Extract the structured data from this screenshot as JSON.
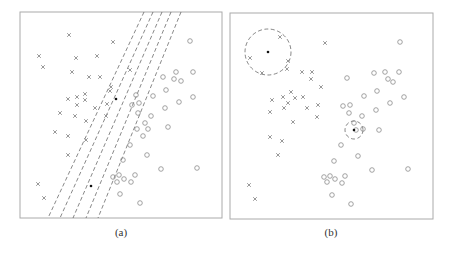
{
  "panels": [
    {
      "id": "a",
      "caption": "(a)",
      "box": {
        "x": 20,
        "y": 12,
        "w": 202,
        "h": 206
      },
      "description": "Several dashed decision lines passing through a common point between classes",
      "crosses": [
        [
          69,
          35
        ],
        [
          39,
          56
        ],
        [
          113,
          42
        ],
        [
          76,
          58
        ],
        [
          97,
          56
        ],
        [
          43,
          67
        ],
        [
          72,
          72
        ],
        [
          89,
          77
        ],
        [
          100,
          77
        ],
        [
          130,
          70
        ],
        [
          111,
          87
        ],
        [
          110,
          91
        ],
        [
          85,
          94
        ],
        [
          77,
          97
        ],
        [
          68,
          99
        ],
        [
          85,
          100
        ],
        [
          77,
          105
        ],
        [
          95,
          108
        ],
        [
          107,
          104
        ],
        [
          60,
          113
        ],
        [
          75,
          116
        ],
        [
          106,
          116
        ],
        [
          86,
          121
        ],
        [
          55,
          132
        ],
        [
          68,
          136
        ],
        [
          86,
          140
        ],
        [
          68,
          155
        ],
        [
          38,
          184
        ],
        [
          44,
          198
        ]
      ],
      "circles": [
        [
          190,
          41
        ],
        [
          163,
          77
        ],
        [
          176,
          72
        ],
        [
          193,
          72
        ],
        [
          174,
          79
        ],
        [
          181,
          81
        ],
        [
          136,
          95
        ],
        [
          153,
          96
        ],
        [
          166,
          90
        ],
        [
          193,
          97
        ],
        [
          132,
          105
        ],
        [
          139,
          103
        ],
        [
          179,
          102
        ],
        [
          165,
          108
        ],
        [
          138,
          113
        ],
        [
          151,
          116
        ],
        [
          145,
          123
        ],
        [
          137,
          129
        ],
        [
          148,
          129
        ],
        [
          168,
          127
        ],
        [
          143,
          136
        ],
        [
          130,
          145
        ],
        [
          147,
          155
        ],
        [
          123,
          160
        ],
        [
          161,
          169
        ],
        [
          197,
          168
        ],
        [
          113,
          177
        ],
        [
          119,
          175
        ],
        [
          124,
          179
        ],
        [
          117,
          182
        ],
        [
          135,
          175
        ],
        [
          131,
          182
        ],
        [
          120,
          194
        ],
        [
          140,
          203
        ]
      ],
      "filled_points": [
        [
          116,
          99
        ],
        [
          91,
          186
        ]
      ],
      "dashed_lines": [
        {
          "top": [
            144,
            12
          ],
          "bottom": [
            48,
            218
          ]
        },
        {
          "top": [
            153,
            12
          ],
          "bottom": [
            60,
            218
          ]
        },
        {
          "top": [
            162,
            12
          ],
          "bottom": [
            73,
            218
          ]
        },
        {
          "top": [
            171,
            12
          ],
          "bottom": [
            86,
            218
          ]
        },
        {
          "top": [
            181,
            12
          ],
          "bottom": [
            98,
            218
          ]
        }
      ]
    },
    {
      "id": "b",
      "caption": "(b)",
      "box": {
        "x": 230,
        "y": 13,
        "w": 203,
        "h": 206
      },
      "description": "Dashed circles centered at query points showing nearest-neighbor regions",
      "crosses": [
        [
          280,
          37
        ],
        [
          325,
          43
        ],
        [
          250,
          58
        ],
        [
          288,
          61
        ],
        [
          287,
          69
        ],
        [
          262,
          73
        ],
        [
          302,
          72
        ],
        [
          312,
          72
        ],
        [
          321,
          87
        ],
        [
          311,
          79
        ],
        [
          291,
          92
        ],
        [
          295,
          98
        ],
        [
          283,
          97
        ],
        [
          303,
          97
        ],
        [
          288,
          103
        ],
        [
          318,
          105
        ],
        [
          307,
          108
        ],
        [
          272,
          100
        ],
        [
          284,
          108
        ],
        [
          270,
          112
        ],
        [
          317,
          117
        ],
        [
          293,
          122
        ],
        [
          270,
          137
        ],
        [
          282,
          141
        ],
        [
          278,
          155
        ],
        [
          249,
          185
        ],
        [
          255,
          199
        ]
      ],
      "circles": [
        [
          400,
          42
        ],
        [
          374,
          73
        ],
        [
          385,
          72
        ],
        [
          399,
          72
        ],
        [
          388,
          79
        ],
        [
          393,
          82
        ],
        [
          347,
          78
        ],
        [
          364,
          96
        ],
        [
          377,
          91
        ],
        [
          404,
          97
        ],
        [
          343,
          106
        ],
        [
          350,
          105
        ],
        [
          390,
          103
        ],
        [
          376,
          110
        ],
        [
          349,
          113
        ],
        [
          362,
          116
        ],
        [
          354,
          123
        ],
        [
          363,
          129
        ],
        [
          356,
          130
        ],
        [
          379,
          130
        ],
        [
          341,
          145
        ],
        [
          358,
          156
        ],
        [
          334,
          161
        ],
        [
          372,
          170
        ],
        [
          408,
          169
        ],
        [
          324,
          177
        ],
        [
          330,
          176
        ],
        [
          335,
          179
        ],
        [
          327,
          182
        ],
        [
          345,
          176
        ],
        [
          342,
          183
        ],
        [
          332,
          195
        ],
        [
          351,
          204
        ]
      ],
      "filled_points": [
        [
          268,
          52
        ],
        [
          354,
          130
        ]
      ],
      "neighborhood_circles": [
        {
          "cx": 268,
          "cy": 52,
          "r": 23
        },
        {
          "cx": 354,
          "cy": 130,
          "r": 9
        }
      ]
    }
  ],
  "colors": {
    "frame": "#aaaaaa",
    "marker": "#8c8c8c",
    "dash": "#555555",
    "dot": "#111111"
  }
}
